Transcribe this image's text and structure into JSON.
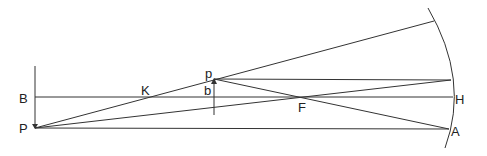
{
  "diagram": {
    "colors": {
      "stroke": "#333333",
      "text": "#222222",
      "background": "#ffffff"
    },
    "labels": {
      "B": "B",
      "P": "P",
      "K": "K",
      "p": "p",
      "b": "b",
      "F": "F",
      "H": "H",
      "A": "A"
    },
    "points": {
      "P": [
        35,
        128
      ],
      "B": [
        35,
        97
      ],
      "K": [
        148,
        97
      ],
      "p": [
        214,
        79
      ],
      "b": [
        214,
        97
      ],
      "F": [
        303,
        97
      ],
      "H": [
        453,
        97
      ],
      "A": [
        449,
        129
      ],
      "upper_mirror_point": [
        434,
        21
      ],
      "mirror_top_reflect": [
        451,
        80
      ]
    }
  }
}
